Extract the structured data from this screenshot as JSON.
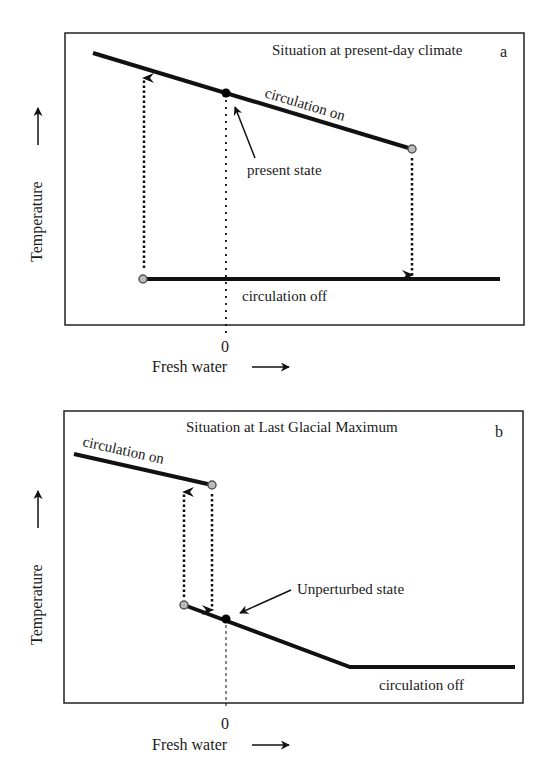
{
  "panels": [
    {
      "id": "a",
      "title": "Situation at present-day climate",
      "letter": "a",
      "y_axis_label": "Temperature",
      "x_axis_label": "Fresh water",
      "x_tick_zero": "0",
      "branch_on_label": "circulation on",
      "branch_off_label": "circulation off",
      "state_label": "present state"
    },
    {
      "id": "b",
      "title": "Situation at Last Glacial Maximum",
      "letter": "b",
      "y_axis_label": "Temperature",
      "x_axis_label": "Fresh water",
      "x_tick_zero": "0",
      "branch_on_label": "circulation on",
      "branch_off_label": "circulation off",
      "state_label": "Unperturbed state"
    }
  ],
  "colors": {
    "line": "#111111",
    "frame": "#222222",
    "hollow_dot_fill": "#bbbbbb",
    "hollow_dot_stroke": "#555555",
    "state_dot": "#000000"
  }
}
